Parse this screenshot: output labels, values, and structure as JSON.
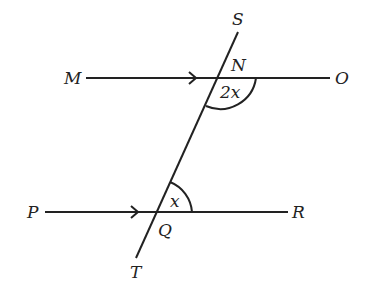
{
  "diagram": {
    "points": {
      "S": "S",
      "N": "N",
      "M": "M",
      "O": "O",
      "P": "P",
      "Q": "Q",
      "R": "R",
      "T": "T"
    },
    "angles": {
      "angle_at_N": "2x",
      "angle_at_Q": "x"
    },
    "lines": [
      {
        "name": "MO",
        "parallel_arrow": true
      },
      {
        "name": "PR",
        "parallel_arrow": true
      },
      {
        "name": "ST",
        "transversal": true
      }
    ],
    "colors": {
      "stroke": "#222222",
      "background": "#ffffff"
    }
  }
}
